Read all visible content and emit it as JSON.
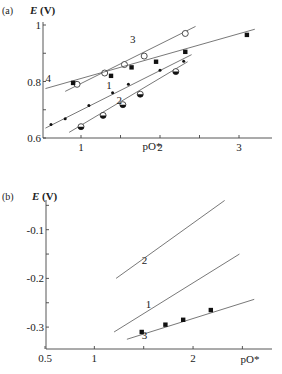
{
  "chart_data": [
    {
      "panel": "(a)",
      "type": "scatter",
      "ylabel_italic": "E",
      "ylabel_unit": "(V)",
      "xlabel": "pO*",
      "xlim": [
        0.4,
        3.5
      ],
      "ylim": [
        0.6,
        1.04
      ],
      "xticks": [
        1,
        1.5,
        2,
        2.5,
        3
      ],
      "xtick_labels": [
        "1",
        "",
        "2",
        "",
        "3"
      ],
      "yticks": [
        0.6,
        0.7,
        0.8,
        0.9,
        1.0
      ],
      "ytick_labels": [
        "0.6",
        "",
        "0.8",
        "",
        "1"
      ],
      "series": [
        {
          "name": "1",
          "marker": "small-dot",
          "x": [
            0.62,
            0.8,
            1.1,
            1.4,
            1.6,
            2.0,
            2.3
          ],
          "y": [
            0.648,
            0.668,
            0.715,
            0.76,
            0.79,
            0.84,
            0.872
          ],
          "fit": [
            [
              0.55,
              0.635
            ],
            [
              2.4,
              0.895
            ]
          ]
        },
        {
          "name": "2",
          "marker": "half-filled-circle",
          "x": [
            1.0,
            1.28,
            1.53,
            1.75,
            2.2
          ],
          "y": [
            0.64,
            0.68,
            0.718,
            0.755,
            0.835
          ],
          "fit": [
            [
              0.85,
              0.62
            ],
            [
              2.35,
              0.87
            ]
          ]
        },
        {
          "name": "3",
          "marker": "open-circle",
          "x": [
            0.95,
            1.3,
            1.55,
            1.8,
            2.32
          ],
          "y": [
            0.79,
            0.83,
            0.86,
            0.89,
            0.97
          ],
          "fit": [
            [
              0.8,
              0.765
            ],
            [
              2.45,
              0.995
            ]
          ]
        },
        {
          "name": "4",
          "marker": "filled-square",
          "x": [
            0.9,
            1.38,
            1.64,
            1.95,
            2.32,
            3.1
          ],
          "y": [
            0.795,
            0.82,
            0.85,
            0.87,
            0.905,
            0.965
          ],
          "fit": [
            [
              0.55,
              0.775
            ],
            [
              3.2,
              0.985
            ]
          ]
        }
      ],
      "curve_labels": [
        {
          "text": "1",
          "x": 1.32,
          "y": 0.775
        },
        {
          "text": "2",
          "x": 1.45,
          "y": 0.72
        },
        {
          "text": "3",
          "x": 1.62,
          "y": 0.935
        },
        {
          "text": "4",
          "x": 0.55,
          "y": 0.8
        }
      ]
    },
    {
      "panel": "(b)",
      "type": "line",
      "ylabel_italic": "E",
      "ylabel_unit": "(V)",
      "xlabel": "pO*",
      "xlim": [
        0.5,
        3.0
      ],
      "ylim": [
        -0.345,
        0.0
      ],
      "xticks": [
        0.5,
        1,
        1.5,
        2,
        2.5
      ],
      "xtick_labels": [
        "0.5",
        "1",
        "",
        "2",
        ""
      ],
      "yticks": [
        -0.05,
        -0.1,
        -0.15,
        -0.2,
        -0.25,
        -0.3
      ],
      "ytick_labels": [
        "",
        "-0.1",
        "",
        "-0.2",
        "",
        "-0.3"
      ],
      "series": [
        {
          "name": "1",
          "marker": "none",
          "fit": [
            [
              1.2,
              -0.31
            ],
            [
              2.47,
              -0.15
            ]
          ]
        },
        {
          "name": "2",
          "marker": "none",
          "fit": [
            [
              1.22,
              -0.2
            ],
            [
              2.32,
              -0.04
            ]
          ]
        },
        {
          "name": "3",
          "marker": "filled-square",
          "x": [
            1.48,
            1.72,
            1.9,
            2.18
          ],
          "y": [
            -0.31,
            -0.295,
            -0.285,
            -0.265
          ],
          "fit": [
            [
              1.33,
              -0.325
            ],
            [
              2.62,
              -0.243
            ]
          ]
        }
      ],
      "curve_labels": [
        {
          "text": "1",
          "x": 1.52,
          "y": -0.26
        },
        {
          "text": "2",
          "x": 1.48,
          "y": -0.17
        },
        {
          "text": "3",
          "x": 1.48,
          "y": -0.325
        }
      ]
    }
  ]
}
